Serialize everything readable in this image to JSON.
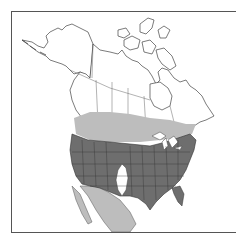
{
  "map": {
    "region": "North America",
    "type": "species range map",
    "legend": [
      {
        "key": "primary-range",
        "color": "#6e6e6e"
      },
      {
        "key": "secondary-range",
        "color": "#bdbdbd"
      },
      {
        "key": "outside-range",
        "color": "#ffffff"
      }
    ],
    "colors": {
      "frame": "#555555",
      "land": "#ffffff",
      "border_lines": "#444444",
      "dark_range": "#6e6e6e",
      "light_range": "#bdbdbd"
    }
  }
}
